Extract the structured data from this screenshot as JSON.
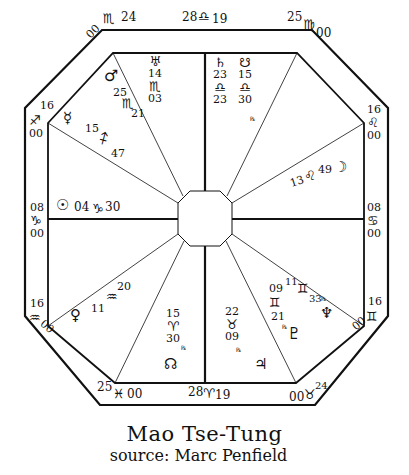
{
  "title": "Mao Tse-Tung",
  "subtitle": "source: Marc Penfield",
  "colors": {
    "ink": "#111111",
    "paper": "#ffffff"
  },
  "cusps": {
    "c11_deg": "24",
    "c11_sign": "♏",
    "c11_min": "00",
    "c10_deg": "28",
    "c10_sign": "♎",
    "c10_min": "19",
    "c9_deg": "25",
    "c9_sign": "♍",
    "c9_min": "00",
    "c8_deg": "16",
    "c8_sign": "♌",
    "c8_min": "00",
    "c7_deg": "08",
    "c7_sign": "♋",
    "c7_min": "00",
    "c6_deg": "16",
    "c6_sign": "♊",
    "c6_min": "00",
    "c5_deg": "24",
    "c5_sign": "♉",
    "c5_min": "00",
    "c4_deg": "28",
    "c4_sign": "♈",
    "c4_min": "19",
    "c3_deg": "25",
    "c3_sign": "♓",
    "c3_min": "00",
    "c2_deg": "16",
    "c2_sign": "♒",
    "c2_min": "00",
    "c1_deg": "08",
    "c1_sign": "♑",
    "c1_min": "00",
    "c12_deg": "16",
    "c12_sign": "♐",
    "c12_min": "00"
  },
  "planets": {
    "uranus": {
      "glyph": "♅",
      "deg": "14",
      "sign": "♏",
      "min": "03"
    },
    "mars": {
      "glyph": "♂",
      "deg": "25",
      "sign": "♏",
      "min": "21"
    },
    "mercury": {
      "glyph": "☿",
      "deg": "15",
      "sign": "♐",
      "min": "47"
    },
    "sun": {
      "glyph": "☉",
      "deg": "04",
      "sign": "♑",
      "min": "30"
    },
    "saturn": {
      "glyph": "♄",
      "deg": "23",
      "sign": "♎",
      "min": "23"
    },
    "south_node": {
      "glyph": "☋",
      "deg": "15",
      "sign": "♎",
      "min": "30",
      "retro": "℞"
    },
    "moon": {
      "glyph": "☽",
      "deg": "13",
      "sign": "♌",
      "min": "49"
    },
    "venus": {
      "glyph": "♀",
      "deg": "11",
      "sign": "♒",
      "min": "20"
    },
    "north_node": {
      "glyph": "☊",
      "deg": "15",
      "sign": "♈",
      "min": "30",
      "retro": "℞"
    },
    "jupiter": {
      "glyph": "♃",
      "deg": "22",
      "sign": "♉",
      "min": "09",
      "retro": "℞"
    },
    "pluto": {
      "glyph": "♇",
      "deg": "09",
      "sign": "♊",
      "min": "21",
      "retro": "℞"
    },
    "neptune": {
      "glyph": "♆",
      "deg": "11",
      "sign": "♊",
      "min": "33",
      "retro": "℞"
    }
  }
}
